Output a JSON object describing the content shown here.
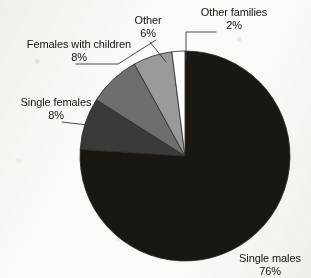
{
  "chart_data": {
    "type": "pie",
    "title": "",
    "subtitle": "",
    "xlabel": "",
    "ylabel": "",
    "legend_position": "none",
    "grid": false,
    "labels_outside": true,
    "start_angle_deg": 0,
    "direction": "clockwise",
    "categories": [
      "Single males",
      "Single females",
      "Females with children",
      "Other",
      "Other families"
    ],
    "values": [
      76,
      8,
      8,
      6,
      2
    ],
    "units": "percent",
    "slices": [
      {
        "label": "Single males",
        "value": 76,
        "pct_text": "76%",
        "color": "#1a1712"
      },
      {
        "label": "Single females",
        "value": 8,
        "pct_text": "8%",
        "color": "#3a3a38"
      },
      {
        "label": "Females with children",
        "value": 8,
        "pct_text": "8%",
        "color": "#6e6e6c"
      },
      {
        "label": "Other",
        "value": 6,
        "pct_text": "6%",
        "color": "#9a9a98"
      },
      {
        "label": "Other families",
        "value": 2,
        "pct_text": "2%",
        "color": "#fdfdfb"
      }
    ]
  },
  "labels": {
    "single_males": {
      "name": "Single males",
      "pct": "76%"
    },
    "single_females": {
      "name": "Single females",
      "pct": "8%"
    },
    "females_with_children": {
      "name": "Females with children",
      "pct": "8%"
    },
    "other": {
      "name": "Other",
      "pct": "6%"
    },
    "other_families": {
      "name": "Other families",
      "pct": "2%"
    }
  },
  "colors": {
    "background": "#fbfaf7",
    "ink": "#15120e",
    "leader_line": "#3b3833",
    "slice_single_males": "#1a1712",
    "slice_single_females": "#3a3a38",
    "slice_females_with_children": "#6e6e6c",
    "slice_other": "#9a9a98",
    "slice_other_families": "#fdfdfb"
  }
}
